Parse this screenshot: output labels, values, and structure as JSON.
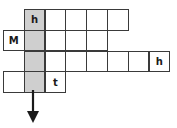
{
  "puzzle": {
    "type": "word-grid",
    "cell_size": 20.8,
    "origin": {
      "x": 3,
      "y": 9
    },
    "shaded_color": "#cfcfcf",
    "rows": [
      {
        "row": 0,
        "start_col": 1,
        "cells": [
          {
            "col": 1,
            "letter": "h",
            "shaded": true
          },
          {
            "col": 2,
            "letter": ""
          },
          {
            "col": 3,
            "letter": ""
          },
          {
            "col": 4,
            "letter": ""
          },
          {
            "col": 5,
            "letter": ""
          }
        ]
      },
      {
        "row": 1,
        "start_col": 0,
        "cells": [
          {
            "col": 0,
            "letter": "M"
          },
          {
            "col": 1,
            "letter": "",
            "shaded": true
          },
          {
            "col": 2,
            "letter": ""
          },
          {
            "col": 3,
            "letter": ""
          },
          {
            "col": 4,
            "letter": ""
          }
        ]
      },
      {
        "row": 2,
        "start_col": 1,
        "cells": [
          {
            "col": 1,
            "letter": "",
            "shaded": true
          },
          {
            "col": 2,
            "letter": ""
          },
          {
            "col": 3,
            "letter": ""
          },
          {
            "col": 4,
            "letter": ""
          },
          {
            "col": 5,
            "letter": ""
          },
          {
            "col": 6,
            "letter": ""
          },
          {
            "col": 7,
            "letter": "h"
          }
        ]
      },
      {
        "row": 3,
        "start_col": 0,
        "cells": [
          {
            "col": 0,
            "letter": ""
          },
          {
            "col": 1,
            "letter": "",
            "shaded": true
          },
          {
            "col": 2,
            "letter": "t"
          }
        ]
      }
    ],
    "arrow": {
      "direction": "down",
      "column": 1
    }
  }
}
